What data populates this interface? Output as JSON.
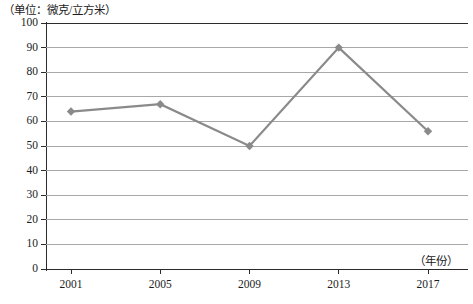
{
  "chart_data": {
    "type": "line",
    "title": "",
    "unit_note": "（单位：微克/立方米）",
    "xlabel": "（年份）",
    "ylabel": "",
    "categories": [
      "2001",
      "2005",
      "2009",
      "2013",
      "2017"
    ],
    "values": [
      64,
      67,
      50,
      90,
      56
    ],
    "series": [
      {
        "name": "浓度",
        "values": [
          64,
          67,
          50,
          90,
          56
        ]
      }
    ],
    "ylim": [
      0,
      100
    ],
    "yticks": [
      0,
      10,
      20,
      30,
      40,
      50,
      60,
      70,
      80,
      90,
      100
    ],
    "ytick_labels": [
      "0",
      "10",
      "20",
      "30",
      "40",
      "50",
      "60",
      "70",
      "80",
      "90",
      "100"
    ],
    "grid": true,
    "grid_axis": "y",
    "legend": "none",
    "marker": "diamond",
    "line_color": "#8a8a8a",
    "marker_color": "#8a8a8a",
    "grid_color": "#a8a8a8",
    "axis_color": "#2b2b2b",
    "text_color": "#1c1c1c"
  }
}
